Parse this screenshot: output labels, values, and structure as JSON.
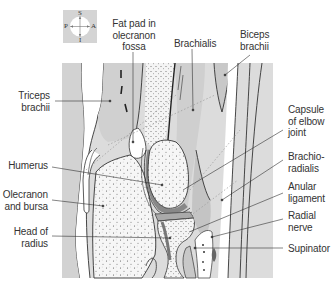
{
  "figure": {
    "type": "anatomical-diagram",
    "panel_color": "#dcdcdc",
    "bone_color": "#f4f4f4",
    "line_color": "#333333",
    "muscle_shade": "#c8c8c8"
  },
  "orientation": {
    "superior": "S",
    "inferior": "I",
    "posterior": "P",
    "anterior": "A"
  },
  "labels": {
    "left": [
      {
        "id": "triceps-brachii",
        "lines": [
          "Triceps",
          "brachii"
        ]
      },
      {
        "id": "humerus",
        "lines": [
          "Humerus"
        ]
      },
      {
        "id": "olecranon-and-bursa",
        "lines": [
          "Olecranon",
          "and bursa"
        ]
      },
      {
        "id": "head-of-radius",
        "lines": [
          "Head of",
          "radius"
        ]
      }
    ],
    "top": [
      {
        "id": "fat-pad",
        "lines": [
          "Fat pad in",
          "olecranon",
          "fossa"
        ]
      },
      {
        "id": "brachialis",
        "lines": [
          "Brachialis"
        ]
      },
      {
        "id": "biceps-brachii",
        "lines": [
          "Biceps",
          "brachii"
        ]
      }
    ],
    "right": [
      {
        "id": "capsule",
        "lines": [
          "Capsule",
          "of elbow",
          "joint"
        ]
      },
      {
        "id": "brachioradialis",
        "lines": [
          "Brachio-",
          "radialis"
        ]
      },
      {
        "id": "anular-ligament",
        "lines": [
          "Anular",
          "ligament"
        ]
      },
      {
        "id": "radial-nerve",
        "lines": [
          "Radial",
          "nerve"
        ]
      },
      {
        "id": "supinator",
        "lines": [
          "Supinator"
        ]
      }
    ]
  }
}
